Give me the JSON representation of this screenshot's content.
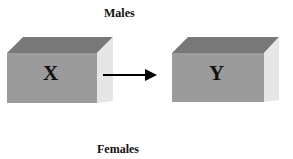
{
  "diagram": {
    "top_label": "Males",
    "bottom_label": "Females",
    "nodes": [
      {
        "id": "X",
        "label": "X"
      },
      {
        "id": "Y",
        "label": "Y"
      }
    ],
    "edges": [
      {
        "from": "X",
        "to": "Y",
        "type": "arrow"
      }
    ],
    "colors": {
      "front_face": "#9b9b9b",
      "top_face": "#787878",
      "side_face": "#e6e6e6",
      "arrow": "#000000",
      "text": "#111111"
    }
  }
}
